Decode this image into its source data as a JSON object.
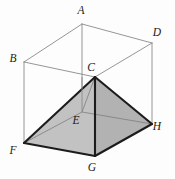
{
  "figure": {
    "kind": "geometry-diagram",
    "background_color": "#fdfdfd",
    "canvas": {
      "width": 175,
      "height": 179
    },
    "colors": {
      "prism_edge": "#8a8a8a",
      "prism_edge_hidden": "#9e9e9e",
      "pyramid_fill_front_left": "#c0c0c0",
      "pyramid_fill_front_right": "#b4b4b4",
      "pyramid_fill_top_left": "#b9b9b9",
      "pyramid_fill_base": "#c6c6c6",
      "pyramid_edge": "#1c1c1c",
      "pyramid_edge_hidden": "#6e6e6e",
      "label_color": "#1a1a1a"
    },
    "vertices": [
      {
        "name": "A",
        "x": 82,
        "y": 24,
        "label_x": 81,
        "label_y": 14,
        "position": "top-back-left"
      },
      {
        "name": "B",
        "x": 24,
        "y": 62,
        "label_x": 13,
        "label_y": 62,
        "position": "top-front-left"
      },
      {
        "name": "C",
        "x": 95,
        "y": 77,
        "label_x": 91,
        "label_y": 71,
        "position": "top-front-right"
      },
      {
        "name": "D",
        "x": 152,
        "y": 43,
        "label_x": 157,
        "label_y": 36,
        "position": "top-back-right"
      },
      {
        "name": "E",
        "x": 82,
        "y": 112,
        "label_x": 76,
        "label_y": 124,
        "position": "bottom-back-left"
      },
      {
        "name": "F",
        "x": 24,
        "y": 143,
        "label_x": 13,
        "label_y": 154,
        "position": "bottom-front-left"
      },
      {
        "name": "G",
        "x": 95,
        "y": 156,
        "label_x": 92,
        "label_y": 171,
        "position": "bottom-front-right"
      },
      {
        "name": "H",
        "x": 152,
        "y": 124,
        "label_x": 157,
        "label_y": 130,
        "position": "bottom-back-right"
      }
    ],
    "prism_edges": [
      {
        "from": "A",
        "to": "B"
      },
      {
        "from": "A",
        "to": "D"
      },
      {
        "from": "B",
        "to": "C"
      },
      {
        "from": "C",
        "to": "D"
      },
      {
        "from": "A",
        "to": "E"
      },
      {
        "from": "B",
        "to": "F"
      },
      {
        "from": "D",
        "to": "H"
      },
      {
        "from": "E",
        "to": "F"
      },
      {
        "from": "E",
        "to": "H"
      }
    ],
    "pyramid": {
      "apex": "C",
      "base": [
        "E",
        "F",
        "G",
        "H"
      ],
      "visible_edges": [
        {
          "from": "C",
          "to": "F"
        },
        {
          "from": "C",
          "to": "G"
        },
        {
          "from": "C",
          "to": "H"
        },
        {
          "from": "F",
          "to": "G"
        },
        {
          "from": "G",
          "to": "H"
        }
      ],
      "hidden_edges": [
        {
          "from": "C",
          "to": "E"
        },
        {
          "from": "E",
          "to": "F"
        },
        {
          "from": "E",
          "to": "H"
        }
      ]
    }
  }
}
